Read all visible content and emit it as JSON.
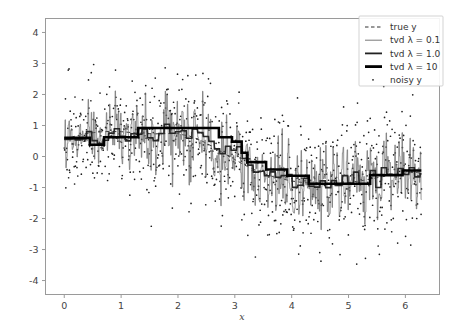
{
  "figure": {
    "background_color": "#ffffff",
    "axes_color": "#9a9a9a",
    "text_color": "#444444"
  },
  "chart_data": {
    "type": "line",
    "title": "",
    "xlabel": "x",
    "ylabel": "",
    "xlim": [
      -0.33,
      6.6
    ],
    "ylim": [
      -4.45,
      4.45
    ],
    "xticks": [
      0,
      1,
      2,
      3,
      4,
      5,
      6
    ],
    "xtick_labels": [
      "0",
      "1",
      "2",
      "3",
      "4",
      "5",
      "6"
    ],
    "yticks": [
      -4,
      -3,
      -2,
      -1,
      0,
      1,
      2,
      3,
      4
    ],
    "ytick_labels": [
      "-4",
      "-3",
      "-2",
      "-1",
      "0",
      "1",
      "2",
      "3",
      "4"
    ],
    "grid": false,
    "legend_position": "upper right",
    "legend": [
      {
        "label": "true y",
        "style": "dashed",
        "width": 1.0,
        "color": "#303030",
        "marker": "none"
      },
      {
        "label": "tvd λ = 0.1",
        "style": "solid",
        "width": 0.8,
        "color": "#555555",
        "marker": "none"
      },
      {
        "label": "tvd λ = 1.0",
        "style": "solid",
        "width": 1.8,
        "color": "#222222",
        "marker": "none"
      },
      {
        "label": "tvd λ = 10",
        "style": "solid",
        "width": 2.8,
        "color": "#000000",
        "marker": "none"
      },
      {
        "label": "noisy y",
        "style": "none",
        "width": 0,
        "color": "#222222",
        "marker": "dot"
      }
    ],
    "series": [
      {
        "name": "true y",
        "kind": "dashed-line",
        "description": "Smooth sine-like curve, amplitude about 0.75, one period across x = 0 to 2*pi",
        "x": [
          0,
          0.2,
          0.4,
          0.6,
          0.8,
          1.0,
          1.2,
          1.4,
          1.6,
          1.8,
          2.0,
          2.2,
          2.4,
          2.6,
          2.8,
          3.0,
          3.2,
          3.4,
          3.6,
          3.8,
          4.0,
          4.2,
          4.4,
          4.6,
          4.8,
          5.0,
          5.2,
          5.4,
          5.6,
          5.8,
          6.0,
          6.28
        ],
        "y": [
          0.55,
          0.66,
          0.74,
          0.79,
          0.81,
          0.8,
          0.77,
          0.74,
          0.73,
          0.74,
          0.73,
          0.66,
          0.52,
          0.33,
          0.11,
          -0.1,
          -0.3,
          -0.47,
          -0.61,
          -0.71,
          -0.79,
          -0.84,
          -0.87,
          -0.88,
          -0.87,
          -0.84,
          -0.79,
          -0.72,
          -0.65,
          -0.58,
          -0.53,
          -0.5
        ]
      },
      {
        "name": "tvd lambda = 0.1",
        "kind": "thin-staircase",
        "description": "Very noisy near-interpolating staircase tracking the scatter, many rapid spikes between about -2.2 and 2.5"
      },
      {
        "name": "tvd lambda = 1.0",
        "kind": "medium-staircase",
        "description": "Moderately smoothed staircase with dozens of short plateaus following the underlying sine shape"
      },
      {
        "name": "tvd lambda = 10",
        "kind": "thick-staircase",
        "description": "Heavily smoothed staircase with about a dozen long plateaus",
        "segments": [
          {
            "x0": 0.0,
            "x1": 0.45,
            "y": 0.6
          },
          {
            "x0": 0.45,
            "x1": 0.7,
            "y": 0.38
          },
          {
            "x0": 0.7,
            "x1": 1.3,
            "y": 0.62
          },
          {
            "x0": 1.3,
            "x1": 2.72,
            "y": 0.92
          },
          {
            "x0": 2.72,
            "x1": 2.95,
            "y": 0.62
          },
          {
            "x0": 2.95,
            "x1": 3.12,
            "y": 0.48
          },
          {
            "x0": 3.12,
            "x1": 3.22,
            "y": 0.12
          },
          {
            "x0": 3.22,
            "x1": 3.55,
            "y": -0.18
          },
          {
            "x0": 3.55,
            "x1": 3.92,
            "y": -0.42
          },
          {
            "x0": 3.92,
            "x1": 4.3,
            "y": -0.62
          },
          {
            "x0": 4.3,
            "x1": 5.38,
            "y": -0.88
          },
          {
            "x0": 5.38,
            "x1": 5.95,
            "y": -0.6
          },
          {
            "x0": 5.95,
            "x1": 6.28,
            "y": -0.45
          }
        ]
      },
      {
        "name": "noisy y",
        "kind": "scatter",
        "marker": "point",
        "marker_size": 1.2,
        "color": "#222222",
        "description": "About 900 small dots scattered around the true sine with gaussian noise of standard deviation roughly 1.0, spanning y from about -3.6 to 4.1"
      }
    ]
  }
}
